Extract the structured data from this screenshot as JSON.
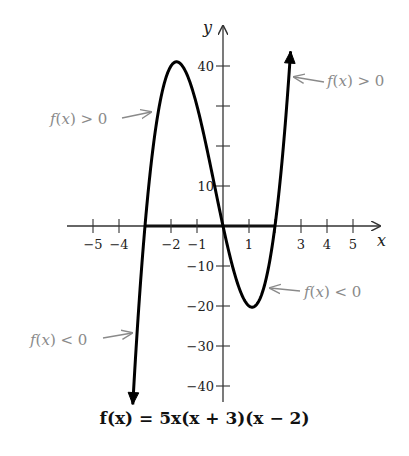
{
  "chart_data": {
    "type": "line",
    "title": "f(x) = 5x(x + 3)(x − 2)",
    "function": "5x(x+3)(x-2)",
    "xlabel": "x",
    "ylabel": "y",
    "xlim": [
      -5.9,
      6.1
    ],
    "ylim": [
      -45,
      48.5
    ],
    "x_ticks": [
      -5,
      -4,
      -3,
      -2,
      -1,
      0,
      1,
      2,
      3,
      4,
      5
    ],
    "x_tick_labels": [
      "-5",
      "-4",
      "-2",
      "-1",
      "1",
      "3",
      "4",
      "5"
    ],
    "x_tick_labeled_values": [
      -5,
      -4,
      -2,
      -1,
      1,
      3,
      4,
      5
    ],
    "y_ticks": [
      -40,
      -30,
      -20,
      -10,
      10,
      20,
      30,
      40
    ],
    "y_tick_labels": [
      "40",
      "10",
      "-10",
      "-20",
      "-30",
      "-40"
    ],
    "y_tick_labeled_values": [
      40,
      10,
      -10,
      -20,
      -30,
      -40
    ],
    "zeros": [
      -3,
      0,
      2
    ],
    "local_max": {
      "x": -1.79,
      "y": 40.6
    },
    "local_min": {
      "x": 1.12,
      "y": -20.4
    },
    "curve_domain": [
      -3.47,
      2.6
    ],
    "highlighted_x_interval": [
      -3,
      2
    ],
    "grid": false,
    "annotations": [
      {
        "text": "f(x) > 0",
        "points_to_x": -2.8,
        "side": "left"
      },
      {
        "text": "f(x) > 0",
        "points_to_x": 2.5,
        "side": "right"
      },
      {
        "text": "f(x) < 0",
        "points_to_x": 1.8,
        "side": "right"
      },
      {
        "text": "f(x) < 0",
        "points_to_x": -3.3,
        "side": "left"
      }
    ]
  },
  "caption": "f(x) = 5x(x + 3)(x − 2)",
  "colors": {
    "curve": "#000000",
    "axis": "#333333",
    "annotation": "#8a8a8a"
  }
}
